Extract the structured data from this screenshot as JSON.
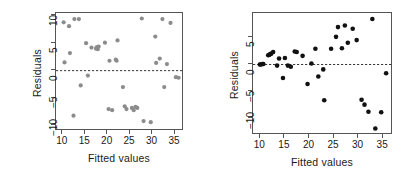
{
  "figure": {
    "type": "residual-plots",
    "panel_count": 2,
    "background": "#ffffff"
  },
  "chart_data": [
    {
      "type": "scatter",
      "title": "",
      "xlabel": "Fitted values",
      "ylabel": "Residuals",
      "xlim": [
        8.5,
        37.0
      ],
      "ylim": [
        -11.0,
        10.5
      ],
      "xticks": [
        10,
        15,
        20,
        25,
        30,
        35
      ],
      "yticks": [
        -10,
        -5,
        0,
        5,
        10
      ],
      "grid": false,
      "legend": null,
      "point_color": "#8c8c8c",
      "point_size": 2.1,
      "reference_line": {
        "y": 0,
        "style": "dashed",
        "color": "#222222"
      },
      "x": [
        10.2,
        10.4,
        11.4,
        11.6,
        12.4,
        12.6,
        13.6,
        14.0,
        15.2,
        15.6,
        16.4,
        17.4,
        17.6,
        17.8,
        18.0,
        19.4,
        20.2,
        20.4,
        21.0,
        21.8,
        22.0,
        22.2,
        23.4,
        23.8,
        24.2,
        25.4,
        25.8,
        26.2,
        26.6,
        27.6,
        28.0,
        29.6,
        30.6,
        30.8,
        31.6,
        32.2,
        32.6,
        33.2,
        34.0,
        35.2,
        35.8
      ],
      "y": [
        8.8,
        1.5,
        8.1,
        3.2,
        -8.2,
        9.4,
        9.4,
        -2.7,
        5.0,
        -0.9,
        4.2,
        4.0,
        4.3,
        3.9,
        4.4,
        5.1,
        -7.0,
        1.8,
        -7.2,
        2.0,
        1.8,
        5.5,
        -3.0,
        -6.5,
        -7.0,
        -6.8,
        -7.2,
        -6.6,
        -6.8,
        9.5,
        -9.2,
        -9.4,
        6.2,
        1.4,
        2.2,
        9.4,
        -3.0,
        1.2,
        8.7,
        -1.2,
        -1.3
      ]
    },
    {
      "type": "scatter",
      "title": "",
      "xlabel": "Fitted values",
      "ylabel": "Residuals",
      "xlim": [
        8.5,
        37.0
      ],
      "ylim": [
        -13.0,
        9.5
      ],
      "xticks": [
        10,
        15,
        20,
        25,
        30,
        35
      ],
      "yticks": [
        -10,
        -5,
        0,
        5
      ],
      "grid": false,
      "legend": null,
      "point_color": "#111111",
      "point_size": 2.3,
      "reference_line": {
        "y": 0,
        "style": "dashed",
        "color": "#222222"
      },
      "x": [
        9.9,
        10.1,
        10.4,
        10.6,
        11.6,
        11.8,
        12.0,
        12.2,
        12.6,
        13.4,
        13.8,
        14.6,
        15.0,
        15.6,
        16.2,
        17.0,
        17.4,
        18.6,
        19.6,
        20.4,
        21.2,
        21.8,
        22.8,
        23.0,
        24.4,
        25.4,
        25.8,
        26.6,
        27.2,
        27.8,
        28.8,
        29.6,
        30.6,
        31.2,
        32.0,
        32.8,
        33.4,
        34.6,
        35.6
      ],
      "y": [
        0.0,
        0.0,
        0.1,
        0.1,
        1.7,
        1.8,
        1.9,
        2.0,
        2.3,
        -0.2,
        1.1,
        -2.5,
        1.2,
        -0.2,
        -0.4,
        2.4,
        2.3,
        1.6,
        -3.6,
        0.2,
        2.9,
        -2.2,
        -0.9,
        -6.6,
        2.9,
        5.1,
        6.9,
        3.0,
        7.2,
        4.0,
        6.6,
        4.5,
        -6.5,
        -7.4,
        -8.7,
        8.4,
        -11.8,
        -8.8,
        -1.6
      ]
    }
  ],
  "panels": [
    {
      "id": "left-panel",
      "ylabel": "Residuals",
      "xlabel": "Fitted values",
      "xticklabels": [
        "10",
        "15",
        "20",
        "25",
        "30",
        "35"
      ],
      "yticklabels": [
        "-10",
        "-5",
        "0",
        "5",
        "10"
      ]
    },
    {
      "id": "right-panel",
      "ylabel": "Residuals",
      "xlabel": "Fitted values",
      "xticklabels": [
        "10",
        "15",
        "20",
        "25",
        "30",
        "35"
      ],
      "yticklabels": [
        "-10",
        "-5",
        "0",
        "5"
      ]
    }
  ]
}
